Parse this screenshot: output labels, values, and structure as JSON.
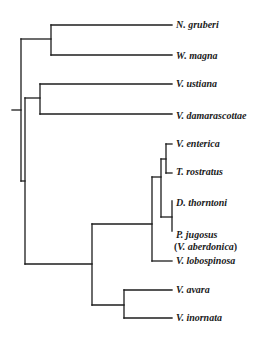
{
  "diagram": {
    "type": "phylogenetic-tree",
    "line_color": "#1c1c1c",
    "background": "#ffffff",
    "taxa": [
      {
        "id": "n-gruberi",
        "label": "N. gruberi",
        "y": 25
      },
      {
        "id": "w-magna",
        "label": "W. magna",
        "y": 55
      },
      {
        "id": "v-ustiana",
        "label": "V. ustiana",
        "y": 84
      },
      {
        "id": "v-damarascottae",
        "label": "V. damarascottae",
        "y": 115
      },
      {
        "id": "v-enterica",
        "label": "V. enterica",
        "y": 145
      },
      {
        "id": "t-rostratus",
        "label": "T. rostratus",
        "y": 172
      },
      {
        "id": "d-thorntoni",
        "label": "D. thorntoni",
        "y": 203
      },
      {
        "id": "p-jugosus",
        "label": "P. jugosus",
        "y": 229,
        "synonym": "V. aberdonica"
      },
      {
        "id": "v-lobospinosa",
        "label": "V. lobospinosa",
        "y": 261
      },
      {
        "id": "v-avara",
        "label": "V. avara",
        "y": 290
      },
      {
        "id": "v-inornata",
        "label": "V. inornata",
        "y": 318
      }
    ],
    "synonym_open": "(",
    "synonym_close": ")",
    "topology": "(((N. gruberi, W. magna), ((V. ustiana, V. damarascottae), ((((V. enterica, T. rostratus), (D. thorntoni, P. jugosus)), V. lobospinosa), (V. avara, V. inornata)))))"
  }
}
